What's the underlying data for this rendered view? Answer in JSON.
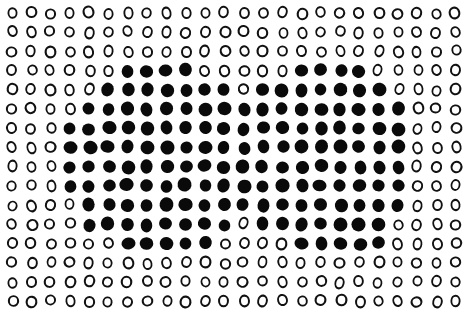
{
  "figure": {
    "rows": 16,
    "cols": 24,
    "layout": {
      "x0": 12,
      "dx": 19.3,
      "y0": 13,
      "dy": 19.2
    },
    "colors": {
      "ink": "#111111",
      "background": "#ffffff"
    },
    "legend": {
      "0": "open-circle",
      "1": "filled-dot"
    },
    "grid": [
      "000000000000000000000000",
      "000000000000000000000000",
      "000000000000000000000000",
      "000000111100000111100000",
      "000001111111011111110000",
      "000011111111111111111000",
      "000111111111111111111000",
      "000111111111111111111000",
      "000111111111111111111000",
      "000111111111111111111000",
      "000011111111111111111000",
      "000011111111011111110000",
      "000000111110000111110000",
      "000000000000000000000000",
      "000000000000000000000000",
      "000000000000000000000000"
    ]
  }
}
